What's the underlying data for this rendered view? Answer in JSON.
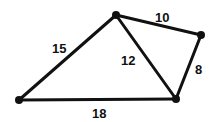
{
  "diagram": {
    "type": "weighted-graph",
    "vertices": [
      {
        "id": "A",
        "x": 116,
        "y": 15
      },
      {
        "id": "B",
        "x": 201,
        "y": 35
      },
      {
        "id": "C",
        "x": 176,
        "y": 99
      },
      {
        "id": "D",
        "x": 19,
        "y": 100
      }
    ],
    "edges": [
      {
        "from": "A",
        "to": "B",
        "weight": "10"
      },
      {
        "from": "B",
        "to": "C",
        "weight": "8"
      },
      {
        "from": "A",
        "to": "C",
        "weight": "12"
      },
      {
        "from": "A",
        "to": "D",
        "weight": "15"
      },
      {
        "from": "D",
        "to": "C",
        "weight": "18"
      }
    ],
    "colors": {
      "line": "#111111",
      "background": "#ffffff"
    }
  }
}
